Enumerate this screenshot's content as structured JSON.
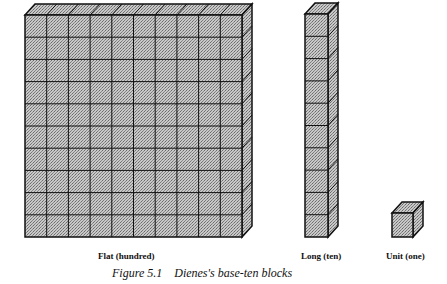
{
  "figure": {
    "caption": "Figure 5.1    Dienes's base-ten blocks",
    "fill_color": "#b5b5b5",
    "line_color": "#111111"
  },
  "blocks": [
    {
      "id": "flat",
      "label": "Flat (hundred)",
      "value": 100,
      "columns": 10,
      "rows": 10
    },
    {
      "id": "long",
      "label": "Long (ten)",
      "value": 10,
      "columns": 1,
      "rows": 10
    },
    {
      "id": "unit",
      "label": "Unit (one)",
      "value": 1,
      "columns": 1,
      "rows": 1
    }
  ]
}
